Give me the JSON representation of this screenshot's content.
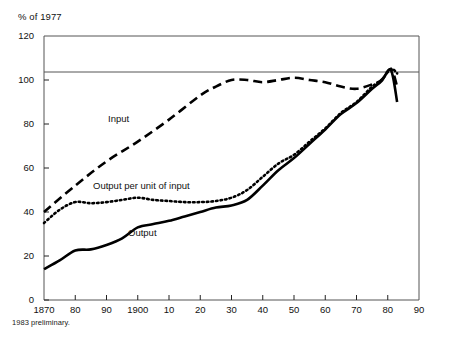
{
  "chart": {
    "axis_title": "% of 1977",
    "footnote": "1983 preliminary.",
    "background_color": "#ffffff",
    "line_color": "#000000",
    "frame_color": "#555555"
  },
  "labels": {
    "input": "Input",
    "output_per_unit": "Output per unit of input",
    "output": "Output"
  },
  "chart_data": {
    "type": "line",
    "title": "",
    "subtitle": "",
    "xlabel": "",
    "ylabel": "% of 1977",
    "xlim": [
      1870,
      1990
    ],
    "ylim": [
      0,
      120
    ],
    "yticks": [
      0,
      20,
      40,
      60,
      80,
      100,
      120
    ],
    "ytick_labels": [
      "0",
      "20",
      "40",
      "60",
      "80",
      "100",
      "120"
    ],
    "xticks": [
      1870,
      1880,
      1890,
      1900,
      1910,
      1920,
      1930,
      1940,
      1950,
      1960,
      1970,
      1980,
      1990
    ],
    "xtick_labels": [
      "1870",
      "80",
      "90",
      "1900",
      "10",
      "20",
      "30",
      "40",
      "50",
      "60",
      "70",
      "80",
      "90"
    ],
    "grid": false,
    "gridlines_y": [
      100
    ],
    "legend": "inline-annotations",
    "annotations": [
      {
        "text": "Input",
        "x": 1898,
        "y": 74
      },
      {
        "text": "Output per unit of input",
        "x": 1898,
        "y": 52
      },
      {
        "text": "Output",
        "x": 1912,
        "y": 30
      }
    ],
    "series": [
      {
        "name": "Input",
        "style": "dashed",
        "x": [
          1870,
          1880,
          1890,
          1900,
          1910,
          1920,
          1925,
          1930,
          1935,
          1940,
          1945,
          1950,
          1955,
          1960,
          1965,
          1970,
          1975,
          1978,
          1981,
          1983
        ],
        "values": [
          40,
          52,
          63,
          72,
          82,
          93,
          97,
          100,
          100,
          99,
          100,
          101,
          100,
          99,
          97,
          96,
          98,
          100,
          105,
          97
        ]
      },
      {
        "name": "Output per unit of input",
        "style": "dotted",
        "x": [
          1870,
          1875,
          1880,
          1885,
          1890,
          1895,
          1900,
          1905,
          1910,
          1915,
          1920,
          1925,
          1930,
          1935,
          1940,
          1945,
          1950,
          1955,
          1960,
          1965,
          1970,
          1975,
          1978,
          1981,
          1983
        ],
        "values": [
          35,
          41,
          44.5,
          44,
          44.5,
          45.5,
          46.5,
          45.5,
          45,
          44.5,
          44.5,
          45,
          46.5,
          50,
          56,
          62,
          66,
          72,
          78,
          85,
          90,
          97,
          100,
          105,
          103
        ]
      },
      {
        "name": "Output",
        "style": "solid",
        "x": [
          1870,
          1875,
          1880,
          1885,
          1890,
          1895,
          1900,
          1905,
          1910,
          1915,
          1920,
          1925,
          1930,
          1935,
          1940,
          1945,
          1950,
          1955,
          1960,
          1965,
          1970,
          1975,
          1978,
          1981,
          1983
        ],
        "values": [
          14,
          18,
          22.5,
          23,
          25,
          28,
          33,
          34.5,
          36,
          38,
          40,
          42,
          43,
          45.5,
          52,
          59,
          64.5,
          71,
          77.5,
          84.5,
          89.5,
          96,
          99.5,
          104.5,
          90
        ]
      }
    ]
  }
}
